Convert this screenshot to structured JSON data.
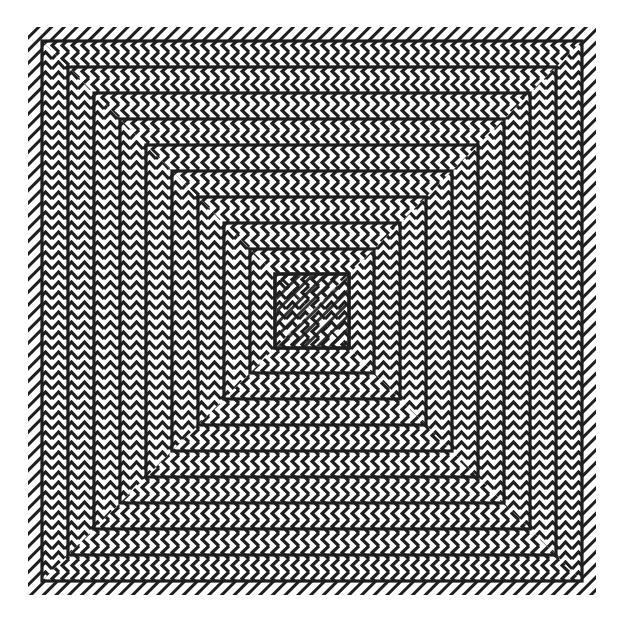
{
  "artwork": {
    "title": "",
    "style": "op-art concentric squares with chevron bands",
    "colors": {
      "ink": "#1e1e1e",
      "paper": "#ffffff"
    },
    "center": [
      312,
      311
    ],
    "outer_hatch_half_size": 284,
    "square_half_sizes": [
      270,
      244,
      218,
      192,
      166,
      140,
      114,
      88,
      62,
      37
    ],
    "chevron_period": 10,
    "stroke_width": 3.2,
    "orientation": {
      "top_bottom_bands": "chevron-left",
      "left_right_bands": "chevron-up",
      "outer_border": "diagonal-hatch"
    }
  }
}
